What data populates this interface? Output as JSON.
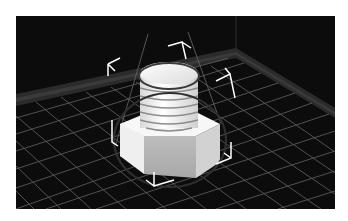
{
  "viewport": {
    "label": "3D viewport",
    "background": "#0c0c0c",
    "grid_color": "#5a5a5a",
    "wall_edge_color": "#3a3a3a",
    "selection_color": "#ffffff",
    "outline_color": "#2a2a2a"
  },
  "model": {
    "name": "bolt",
    "body_color": "#f2f2f2",
    "shade_color": "#bdbdbd"
  }
}
